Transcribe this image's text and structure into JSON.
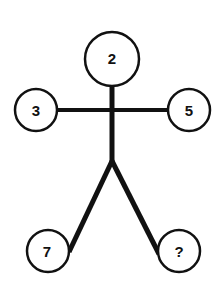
{
  "puzzle": {
    "type": "stick-figure number puzzle",
    "head": "2",
    "left_hand": "3",
    "right_hand": "5",
    "left_foot": "7",
    "right_foot": "?"
  },
  "colors": {
    "line": "#111111",
    "background": "#ffffff"
  }
}
